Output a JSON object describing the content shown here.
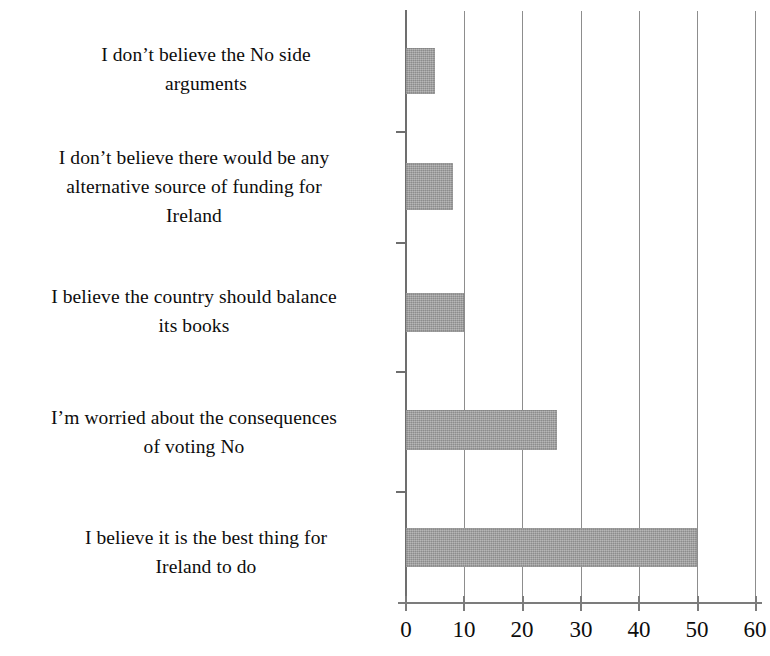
{
  "chart_data": {
    "type": "bar",
    "orientation": "horizontal",
    "title": "",
    "subtitle": "",
    "xlabel": "",
    "ylabel": "",
    "categories": [
      "I don’t believe the No side\narguments",
      "I don’t believe there would be any\nalternative source of funding for\nIreland",
      "I believe the country should balance\nits books",
      "I’m worried about the consequences\nof voting No",
      "I believe it is the best thing for\nIreland to do"
    ],
    "values": [
      5,
      8,
      10,
      26,
      50
    ],
    "xlim": [
      0,
      60
    ],
    "x_ticks": [
      "0",
      "10",
      "20",
      "30",
      "40",
      "50",
      "60"
    ],
    "x_tick_values": [
      0,
      10,
      20,
      30,
      40,
      50,
      60
    ],
    "grid": "vertical",
    "legend": "none",
    "bar_color": "#9c9c9c",
    "axis_color": "#7c7c7c",
    "text_color": "#0d0d0d"
  }
}
